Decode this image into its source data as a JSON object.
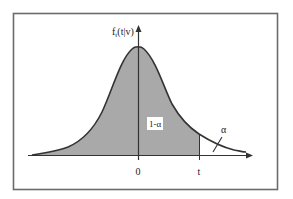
{
  "diagram": {
    "type": "probability density (Student's t distribution)",
    "y_axis_label": "f_t(t|v)",
    "y_axis_label_main": "f",
    "y_axis_label_sub": "t",
    "y_axis_label_rest": "(t|v)",
    "x_ticks": [
      {
        "label": "0",
        "position": "mean"
      },
      {
        "label": "t",
        "position": "critical value"
      }
    ],
    "regions": [
      {
        "label": "1-α",
        "description": "shaded area under curve left of t"
      },
      {
        "label": "α",
        "description": "unshaded right tail beyond t"
      }
    ],
    "colors": {
      "frame": "#6b6b6b",
      "shade": "#a9a9a9",
      "curve": "#333333",
      "axis": "#333333",
      "background": "#ffffff",
      "label_box": "#ffffff"
    }
  }
}
